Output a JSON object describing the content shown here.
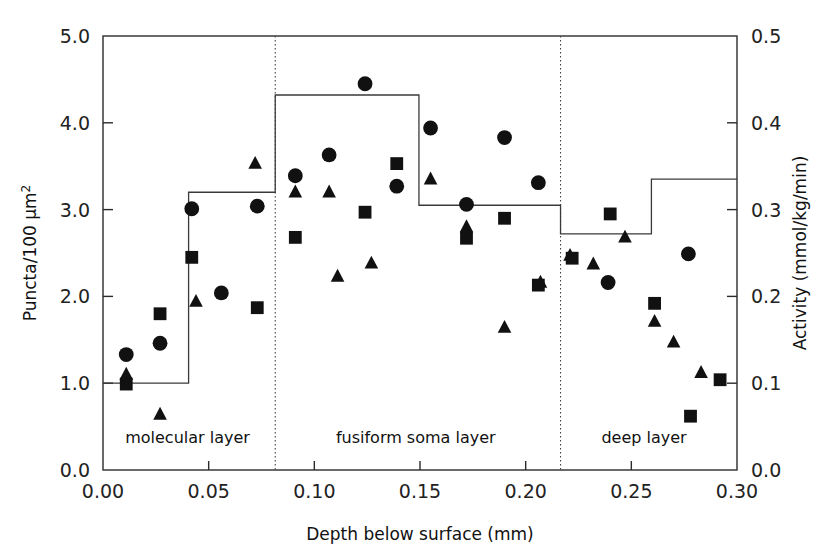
{
  "chart_data": {
    "type": "scatter",
    "title": "",
    "xlabel": "Depth below surface (mm)",
    "ylabel_left": "Puncta/100 μm²",
    "ylabel_right": "Activity (mmol/kg/min)",
    "xlim": [
      0.0,
      0.3
    ],
    "ylim_left": [
      0.0,
      5.0
    ],
    "ylim_right": [
      0.0,
      0.5
    ],
    "grid": false,
    "legend": "none",
    "xticks": [
      "0.00",
      "0.05",
      "0.10",
      "0.15",
      "0.20",
      "0.25",
      "0.30"
    ],
    "xtick_values": [
      0.0,
      0.05,
      0.1,
      0.15,
      0.2,
      0.25,
      0.3
    ],
    "yticks_left": [
      "0.0",
      "1.0",
      "2.0",
      "3.0",
      "4.0",
      "5.0"
    ],
    "ytick_values_left": [
      0.0,
      1.0,
      2.0,
      3.0,
      4.0,
      5.0
    ],
    "yticks_right": [
      "0.0",
      "0.1",
      "0.2",
      "0.3",
      "0.4",
      "0.5"
    ],
    "ytick_values_right": [
      0.0,
      0.1,
      0.2,
      0.3,
      0.4,
      0.5
    ],
    "region_labels": [
      {
        "text": "molecular layer",
        "x": 0.04
      },
      {
        "text": "fusiform soma layer",
        "x": 0.148
      },
      {
        "text": "deep layer",
        "x": 0.256
      }
    ],
    "region_dividers": [
      0.0815,
      0.2165
    ],
    "series": [
      {
        "name": "circle-series",
        "marker": "circle",
        "points": [
          {
            "x": 0.011,
            "y": 1.33
          },
          {
            "x": 0.027,
            "y": 1.46
          },
          {
            "x": 0.042,
            "y": 3.01
          },
          {
            "x": 0.056,
            "y": 2.04
          },
          {
            "x": 0.073,
            "y": 3.04
          },
          {
            "x": 0.091,
            "y": 3.39
          },
          {
            "x": 0.107,
            "y": 3.63
          },
          {
            "x": 0.124,
            "y": 4.45
          },
          {
            "x": 0.139,
            "y": 3.27
          },
          {
            "x": 0.155,
            "y": 3.94
          },
          {
            "x": 0.172,
            "y": 3.06
          },
          {
            "x": 0.19,
            "y": 3.83
          },
          {
            "x": 0.206,
            "y": 3.31
          },
          {
            "x": 0.239,
            "y": 2.16
          },
          {
            "x": 0.277,
            "y": 2.49
          }
        ]
      },
      {
        "name": "square-series",
        "marker": "square",
        "points": [
          {
            "x": 0.011,
            "y": 0.99
          },
          {
            "x": 0.027,
            "y": 1.8
          },
          {
            "x": 0.042,
            "y": 2.45
          },
          {
            "x": 0.073,
            "y": 1.87
          },
          {
            "x": 0.091,
            "y": 2.68
          },
          {
            "x": 0.124,
            "y": 2.97
          },
          {
            "x": 0.139,
            "y": 3.53
          },
          {
            "x": 0.172,
            "y": 2.67
          },
          {
            "x": 0.19,
            "y": 2.9
          },
          {
            "x": 0.206,
            "y": 2.13
          },
          {
            "x": 0.222,
            "y": 2.44
          },
          {
            "x": 0.24,
            "y": 2.95
          },
          {
            "x": 0.261,
            "y": 1.92
          },
          {
            "x": 0.278,
            "y": 0.62
          },
          {
            "x": 0.292,
            "y": 1.04
          }
        ]
      },
      {
        "name": "triangle-series",
        "marker": "triangle",
        "points": [
          {
            "x": 0.011,
            "y": 1.1
          },
          {
            "x": 0.027,
            "y": 0.64
          },
          {
            "x": 0.044,
            "y": 1.94
          },
          {
            "x": 0.072,
            "y": 3.53
          },
          {
            "x": 0.091,
            "y": 3.2
          },
          {
            "x": 0.107,
            "y": 3.2
          },
          {
            "x": 0.111,
            "y": 2.23
          },
          {
            "x": 0.127,
            "y": 2.38
          },
          {
            "x": 0.155,
            "y": 3.35
          },
          {
            "x": 0.172,
            "y": 2.8
          },
          {
            "x": 0.19,
            "y": 1.64
          },
          {
            "x": 0.207,
            "y": 2.16
          },
          {
            "x": 0.221,
            "y": 2.47
          },
          {
            "x": 0.232,
            "y": 2.37
          },
          {
            "x": 0.247,
            "y": 2.68
          },
          {
            "x": 0.261,
            "y": 1.71
          },
          {
            "x": 0.27,
            "y": 1.47
          },
          {
            "x": 0.283,
            "y": 1.12
          }
        ]
      }
    ],
    "step_line": {
      "name": "activity-step",
      "axis": "right",
      "steps": [
        {
          "x0": 0.0,
          "x1": 0.0405,
          "y": 1.0
        },
        {
          "x0": 0.0405,
          "x1": 0.0815,
          "y": 3.2
        },
        {
          "x0": 0.0815,
          "x1": 0.1495,
          "y": 4.32
        },
        {
          "x0": 0.1495,
          "x1": 0.2165,
          "y": 3.05
        },
        {
          "x0": 0.2165,
          "x1": 0.2595,
          "y": 2.72
        },
        {
          "x0": 0.2595,
          "x1": 0.3,
          "y": 3.35
        }
      ]
    }
  }
}
